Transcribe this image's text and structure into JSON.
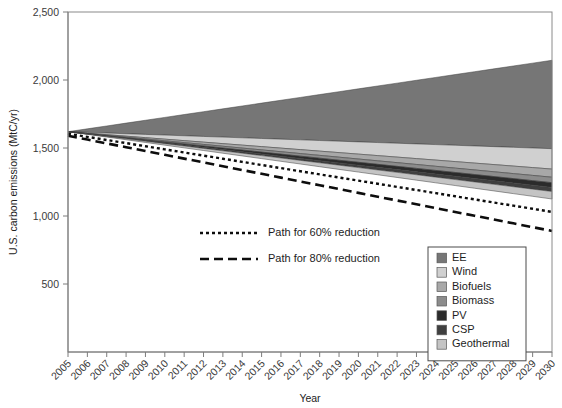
{
  "chart_data": {
    "type": "area",
    "title": "",
    "xlabel": "Year",
    "ylabel": "U.S. carbon emissions (MtC/yr)",
    "xlim": [
      2005,
      2030
    ],
    "ylim": [
      0,
      2500
    ],
    "yticks": [
      500,
      1000,
      1500,
      2000,
      2500
    ],
    "ytick_labels": [
      "500",
      "1,000",
      "1,500",
      "2,000",
      "2,500"
    ],
    "grid": false,
    "legend_position": "bottom-right",
    "x": [
      2005,
      2006,
      2007,
      2008,
      2009,
      2010,
      2011,
      2012,
      2013,
      2014,
      2015,
      2016,
      2017,
      2018,
      2019,
      2020,
      2021,
      2022,
      2023,
      2024,
      2025,
      2026,
      2027,
      2028,
      2029,
      2030
    ],
    "xtick_labels": [
      "2005",
      "2006",
      "2007",
      "2008",
      "2009",
      "2010",
      "2011",
      "2012",
      "2013",
      "2014",
      "2015",
      "2016",
      "2017",
      "2018",
      "2019",
      "2020",
      "2021",
      "2022",
      "2023",
      "2024",
      "2025",
      "2026",
      "2027",
      "2028",
      "2029",
      "2030"
    ],
    "baseline_name": "Reference emissions (stack top)",
    "baseline": [
      1620,
      1641,
      1662,
      1683,
      1704,
      1725,
      1746,
      1767,
      1788,
      1809,
      1830,
      1851,
      1872,
      1893,
      1914,
      1935,
      1956,
      1977,
      1998,
      2019,
      2040,
      2061,
      2082,
      2103,
      2124,
      2145
    ],
    "stack_order_top_to_bottom": [
      "EE",
      "Wind",
      "Biofuels",
      "Biomass",
      "PV",
      "CSP",
      "Geothermal"
    ],
    "series": [
      {
        "name": "EE",
        "color": "#767676",
        "values": [
          0,
          26,
          52,
          78,
          104,
          130,
          156,
          182,
          208,
          234,
          260,
          286,
          312,
          338,
          364,
          390,
          416,
          442,
          468,
          494,
          520,
          546,
          572,
          598,
          624,
          650
        ]
      },
      {
        "name": "Wind",
        "color": "#d0d0d0",
        "values": [
          0,
          6,
          12,
          18,
          24,
          30,
          36,
          42,
          48,
          54,
          60,
          66,
          72,
          78,
          84,
          90,
          96,
          102,
          108,
          114,
          120,
          126,
          132,
          138,
          144,
          150
        ]
      },
      {
        "name": "Biofuels",
        "color": "#a8a8a8",
        "values": [
          0,
          2.4,
          4.8,
          7.2,
          9.6,
          12,
          14.4,
          16.8,
          19.2,
          21.6,
          24,
          26.4,
          28.8,
          31.2,
          33.6,
          36,
          38.4,
          40.8,
          43.2,
          45.6,
          48,
          50.4,
          52.8,
          55.2,
          57.6,
          60
        ]
      },
      {
        "name": "Biomass",
        "color": "#8c8c8c",
        "values": [
          0,
          1.6,
          3.2,
          4.8,
          6.4,
          8,
          9.6,
          11.2,
          12.8,
          14.4,
          16,
          17.6,
          19.2,
          20.8,
          22.4,
          24,
          25.6,
          27.2,
          28.8,
          30.4,
          32,
          33.6,
          35.2,
          36.8,
          38.4,
          40
        ]
      },
      {
        "name": "PV",
        "color": "#2b2b2b",
        "values": [
          0,
          1.4,
          2.8,
          4.2,
          5.6,
          7,
          8.4,
          9.8,
          11.2,
          12.6,
          14,
          15.4,
          16.8,
          18.2,
          19.6,
          21,
          22.4,
          23.8,
          25.2,
          26.6,
          28,
          29.4,
          30.8,
          32.2,
          33.6,
          35
        ]
      },
      {
        "name": "CSP",
        "color": "#3f3f3f",
        "values": [
          0,
          1.2,
          2.4,
          3.6,
          4.8,
          6,
          7.2,
          8.4,
          9.6,
          10.8,
          12,
          13.2,
          14.4,
          15.6,
          16.8,
          18,
          19.2,
          20.4,
          21.6,
          22.8,
          24,
          25.2,
          26.4,
          27.6,
          28.8,
          30
        ]
      },
      {
        "name": "Geothermal",
        "color": "#c4c4c4",
        "values": [
          0,
          2.2,
          4.4,
          6.6,
          8.8,
          11,
          13.2,
          15.4,
          17.6,
          19.8,
          22,
          24.2,
          26.4,
          28.6,
          30.8,
          33,
          35.2,
          37.4,
          39.6,
          41.8,
          44,
          46.2,
          48.4,
          50.6,
          52.8,
          55
        ]
      }
    ],
    "reduction_paths": [
      {
        "name": "Path for 60% reduction",
        "dash": "3,3",
        "width": 2.4,
        "values": [
          1605,
          1582,
          1559,
          1536,
          1513,
          1490,
          1467,
          1444,
          1421,
          1398,
          1375,
          1352,
          1329,
          1306,
          1283,
          1260,
          1237,
          1214,
          1191,
          1168,
          1145,
          1122,
          1099,
          1076,
          1053,
          1030
        ]
      },
      {
        "name": "Path for 80% reduction",
        "dash": "9,5",
        "width": 2.6,
        "values": [
          1590,
          1562,
          1534,
          1506,
          1478,
          1450,
          1422,
          1394,
          1366,
          1338,
          1310,
          1282,
          1254,
          1226,
          1198,
          1170,
          1142,
          1114,
          1086,
          1058,
          1030,
          1002,
          974,
          946,
          918,
          890
        ]
      }
    ]
  },
  "legend": {
    "items": [
      {
        "label": "EE",
        "color": "#767676"
      },
      {
        "label": "Wind",
        "color": "#d0d0d0"
      },
      {
        "label": "Biofuels",
        "color": "#a8a8a8"
      },
      {
        "label": "Biomass",
        "color": "#8c8c8c"
      },
      {
        "label": "PV",
        "color": "#2b2b2b"
      },
      {
        "label": "CSP",
        "color": "#3f3f3f"
      },
      {
        "label": "Geothermal",
        "color": "#c4c4c4"
      }
    ]
  },
  "path_legend": {
    "items": [
      {
        "label": "Path for 60% reduction",
        "dash": "3,3"
      },
      {
        "label": "Path for 80% reduction",
        "dash": "9,5"
      }
    ]
  },
  "colors": {
    "background": "#ffffff",
    "axis": "#7c7c7c",
    "text": "#1d1d1d",
    "line": "#0d0d0d"
  }
}
